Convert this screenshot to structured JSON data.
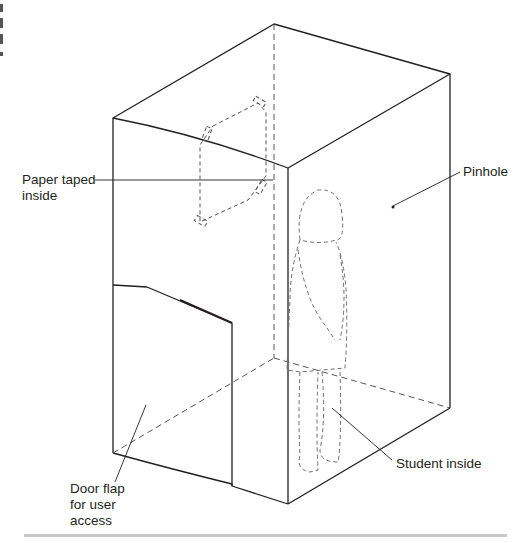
{
  "figure": {
    "labels": {
      "paper": "Paper taped\ninside",
      "pinhole": "Pinhole",
      "door": "Door flap\nfor user\naccess",
      "student": "Student inside"
    },
    "colors": {
      "line": "#231f20",
      "dashed": "#6d6d6d",
      "rule": "#c8c8c8"
    }
  }
}
